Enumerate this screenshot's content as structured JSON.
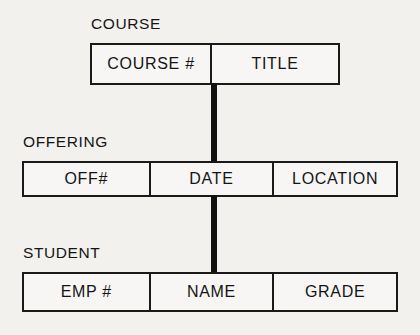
{
  "diagram": {
    "background_color": "#f2f1ee",
    "line_color": "#1a1a1a",
    "entities": [
      {
        "label": "COURSE",
        "cells": [
          {
            "text": "COURSE #"
          },
          {
            "text": "TITLE"
          }
        ]
      },
      {
        "label": "OFFERING",
        "cells": [
          {
            "text": "OFF#"
          },
          {
            "text": "DATE"
          },
          {
            "text": "LOCATION"
          }
        ]
      },
      {
        "label": "STUDENT",
        "cells": [
          {
            "text": "EMP #"
          },
          {
            "text": "NAME"
          },
          {
            "text": "GRADE"
          }
        ]
      }
    ],
    "connectors": [
      {
        "name": "course-to-offering"
      },
      {
        "name": "offering-to-student"
      }
    ]
  }
}
